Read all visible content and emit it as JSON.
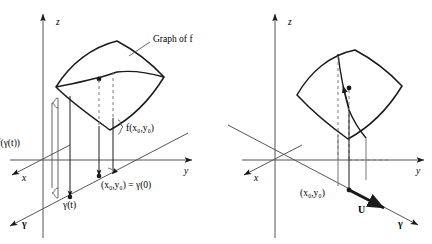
{
  "figure": {
    "background_color": "#ffffff",
    "stroke_color": "#1a1a1a",
    "dashed_color": "#7a7a7a",
    "axis_color": "#555555",
    "panels": [
      {
        "name": "left-panel",
        "axes": {
          "x": "x",
          "y": "y",
          "z": "z"
        },
        "gamma_axis_label": "γ",
        "surface_label": "Graph of f",
        "labels": {
          "height_along_curve": "f(γ(t))",
          "height_at_point": "f(x₀,y₀)",
          "domain_point": "(x₀,y₀) = γ(0)",
          "curve_point": "γ(t)"
        }
      },
      {
        "name": "right-panel",
        "axes": {
          "x": "x",
          "y": "y",
          "z": "z"
        },
        "gamma_axis_label": "γ",
        "labels": {
          "domain_point": "(x₀,y₀)",
          "direction_vector": "U"
        }
      }
    ]
  }
}
